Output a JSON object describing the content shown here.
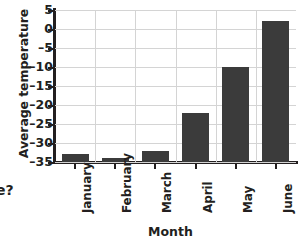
{
  "chart_data": {
    "type": "bar",
    "title": "",
    "xlabel": "Month",
    "ylabel": "Average temperature",
    "categories": [
      "January",
      "February",
      "March",
      "April",
      "May",
      "June"
    ],
    "values": [
      -33,
      -34,
      -32,
      -22,
      -10,
      2
    ],
    "ylim": [
      -35,
      5
    ],
    "yticks": [
      5,
      0,
      -5,
      -10,
      -15,
      -20,
      -25,
      -30,
      -35
    ],
    "ytick_labels": [
      "5",
      "0",
      "–5",
      "–10",
      "–15",
      "–20",
      "–25",
      "–30",
      "–35"
    ],
    "grid": "horizontal-and-vertical",
    "legend": "none",
    "bar_color": "#3b3b3b",
    "gridline_color": "#d4d4d4",
    "axis_color": "#231f20",
    "background_color": "#ffffff"
  },
  "cropped_text": {
    "fragment": "e?"
  }
}
